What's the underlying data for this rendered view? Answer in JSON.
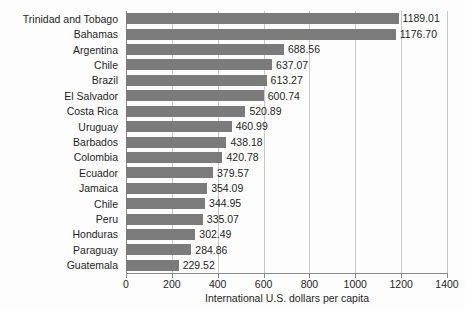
{
  "chart_data": {
    "type": "bar",
    "orientation": "horizontal",
    "title": "",
    "subtitle": "",
    "xlabel": "International U.S. dollars per capita",
    "ylabel": "",
    "xlim": [
      0,
      1400
    ],
    "xticks": [
      0,
      200,
      400,
      600,
      800,
      1000,
      1200,
      1400
    ],
    "grid": "vertical",
    "legend": "none",
    "bar_color": "#7b7b7b",
    "categories": [
      "Trinidad and Tobago",
      "Bahamas",
      "Argentina",
      "Chile",
      "Brazil",
      "El Salvador",
      "Costa Rica",
      "Uruguay",
      "Barbados",
      "Colombia",
      "Ecuador",
      "Jamaica",
      "Chile",
      "Peru",
      "Honduras",
      "Paraguay",
      "Guatemala"
    ],
    "values": [
      1189.01,
      1176.7,
      688.56,
      637.07,
      613.27,
      600.74,
      520.89,
      460.99,
      438.18,
      420.78,
      379.57,
      354.09,
      344.95,
      335.07,
      302.49,
      284.86,
      229.52
    ],
    "value_labels": [
      "1189.01",
      "1176.70",
      "688.56",
      "637.07",
      "613.27",
      "600.74",
      "520.89",
      "460.99",
      "438.18",
      "420.78",
      "379.57",
      "354.09",
      "344.95",
      "335.07",
      "302.49",
      "284.86",
      "229.52"
    ]
  }
}
